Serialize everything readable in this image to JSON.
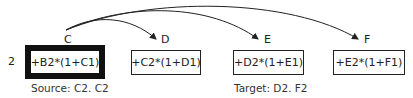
{
  "diagram": {
    "row_label": "2",
    "columns": [
      {
        "letter": "C",
        "formula": "+B2*(1+C1)",
        "role": "source"
      },
      {
        "letter": "D",
        "formula": "+C2*(1+D1)",
        "role": "target"
      },
      {
        "letter": "E",
        "formula": "+D2*(1+E1)",
        "role": "target"
      },
      {
        "letter": "F",
        "formula": "+E2*(1+F1)",
        "role": "target"
      }
    ],
    "source_caption": "Source: C2. C2",
    "target_caption": "Target: D2. F2",
    "arrows": [
      {
        "from": "C",
        "to": "D"
      },
      {
        "from": "C",
        "to": "E"
      },
      {
        "from": "C",
        "to": "F"
      }
    ]
  }
}
